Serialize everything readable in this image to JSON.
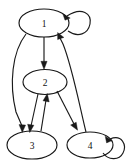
{
  "diagram": {
    "type": "directed-graph",
    "title": "",
    "background_color": "#ffffff",
    "stroke_color": "#1a1a1a",
    "label_color": "#111111",
    "nodes": [
      {
        "id": "1",
        "label": "1",
        "cx": 44,
        "cy": 23,
        "rx": 25,
        "ry": 14
      },
      {
        "id": "2",
        "label": "2",
        "cx": 45,
        "cy": 82,
        "rx": 22,
        "ry": 12.5
      },
      {
        "id": "3",
        "label": "3",
        "cx": 32,
        "cy": 145,
        "rx": 25,
        "ry": 14
      },
      {
        "id": "4",
        "label": "4",
        "cx": 90,
        "cy": 145,
        "rx": 23,
        "ry": 13
      }
    ],
    "edges": [
      {
        "id": "e1",
        "from": "1",
        "to": "1",
        "kind": "self-loop",
        "side": "right"
      },
      {
        "id": "e2",
        "from": "1",
        "to": "2",
        "kind": "straight"
      },
      {
        "id": "e3",
        "from": "1",
        "to": "3",
        "kind": "curve-left"
      },
      {
        "id": "e4",
        "from": "2",
        "to": "3",
        "kind": "straight"
      },
      {
        "id": "e5",
        "from": "3",
        "to": "2",
        "kind": "straight"
      },
      {
        "id": "e6",
        "from": "2",
        "to": "4",
        "kind": "straight"
      },
      {
        "id": "e7",
        "from": "4",
        "to": "1",
        "kind": "curve-right"
      },
      {
        "id": "e8",
        "from": "4",
        "to": "4",
        "kind": "self-loop",
        "side": "right"
      }
    ]
  }
}
